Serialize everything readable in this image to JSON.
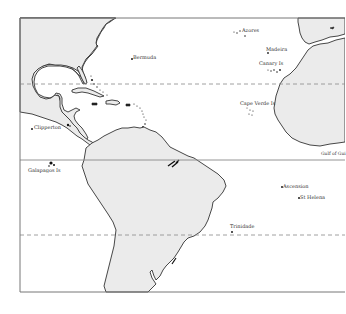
{
  "map": {
    "title": "",
    "colors": {
      "land": "#ebebeb",
      "coastline": "#333333",
      "ocean": "#ffffff",
      "grid_lines": "#888888"
    },
    "lines": {
      "equator": "solid",
      "tropic_of_cancer": "dashed",
      "tropic_of_capricorn": "dashed"
    },
    "labels": {
      "bermuda": "Bermuda",
      "azores": "Azores",
      "madeira": "Madeira",
      "canary": "Canary Is",
      "cape_verde": "Cape Verde Is",
      "clipperton": "Clipperton",
      "galapagos": "Galapagos Is",
      "gulf_of_guinea": "Gulf of Gui",
      "ascension": "Ascension",
      "st_helena": "St Helena",
      "trinidade": "Trinidade"
    }
  }
}
